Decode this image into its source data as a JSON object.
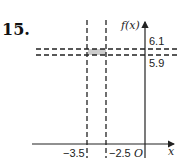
{
  "problem_number": "15.",
  "axes": {
    "y_label": "f(x)",
    "x_label": "x",
    "origin_label": "O"
  },
  "vertical_lines": [
    {
      "label": "−3.5",
      "x_value": -3.5
    },
    {
      "label": "−2.5",
      "x_value": -2.5
    }
  ],
  "horizontal_lines": [
    {
      "label": "6.1",
      "y_value": 6.1
    },
    {
      "label": "5.9",
      "y_value": 5.9
    }
  ],
  "shaded_region": {
    "x": [
      -3.5,
      -2.5
    ],
    "y": [
      5.9,
      6.1
    ],
    "color": "#cccccc"
  },
  "colors": {
    "line": "#222222",
    "shade": "#cccccc"
  }
}
